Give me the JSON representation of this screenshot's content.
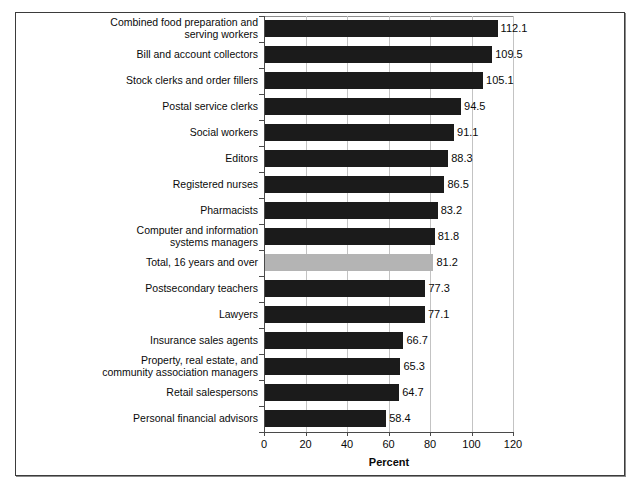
{
  "chart_data": {
    "type": "bar",
    "orientation": "horizontal",
    "title": "",
    "xlabel": "Percent",
    "ylabel": "",
    "xlim": [
      0,
      120
    ],
    "xticks": [
      0,
      20,
      40,
      60,
      80,
      100,
      120
    ],
    "grid": true,
    "legend": null,
    "highlight_category": "Total, 16 years and over",
    "colors": {
      "bar": "#1b1b1b",
      "highlight_bar": "#b4b4b4",
      "grid": "#c3c3c3",
      "axis": "#4a4a4a",
      "frame": "#3b3b3b",
      "text": "#0a0a0a",
      "background": "#ffffff"
    },
    "categories": [
      "Combined food preparation and\nserving workers",
      "Bill and account collectors",
      "Stock clerks and order fillers",
      "Postal service clerks",
      "Social workers",
      "Editors",
      "Registered nurses",
      "Pharmacists",
      "Computer and information\nsystems managers",
      "Total, 16 years and over",
      "Postsecondary teachers",
      "Lawyers",
      "Insurance sales agents",
      "Property, real estate, and\ncommunity association managers",
      "Retail salespersons",
      "Personal financial advisors"
    ],
    "values": [
      112.1,
      109.5,
      105.1,
      94.5,
      91.1,
      88.3,
      86.5,
      83.2,
      81.8,
      81.2,
      77.3,
      77.1,
      66.7,
      65.3,
      64.7,
      58.4
    ],
    "value_labels": [
      "112.1",
      "109.5",
      "105.1",
      "94.5",
      "91.1",
      "88.3",
      "86.5",
      "83.2",
      "81.8",
      "81.2",
      "77.3",
      "77.1",
      "66.7",
      "65.3",
      "64.7",
      "58.4"
    ],
    "xtick_labels": [
      "0",
      "20",
      "40",
      "60",
      "80",
      "100",
      "120"
    ]
  }
}
